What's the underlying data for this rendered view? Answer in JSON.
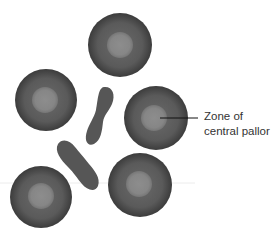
{
  "diagram": {
    "label": {
      "line1": "Zone of",
      "line2": "central pallor"
    },
    "colors": {
      "background": "#ffffff",
      "cell_rim": "#3f3f3f",
      "cell_body": "#5e5e5e",
      "pallor": "#8a8a8a",
      "sickle": "#555555",
      "leader_line": "#111111",
      "text": "#333333",
      "scan_line": "#ececec"
    },
    "cells": [
      {
        "name": "top",
        "cx": 120,
        "cy": 45,
        "r": 32,
        "pallor_r": 13
      },
      {
        "name": "left",
        "cx": 46,
        "cy": 100,
        "r": 31,
        "pallor_r": 13
      },
      {
        "name": "right",
        "cx": 156,
        "cy": 118,
        "r": 32,
        "pallor_r": 13
      },
      {
        "name": "bottom-right",
        "cx": 140,
        "cy": 185,
        "r": 32,
        "pallor_r": 13
      },
      {
        "name": "bottom-left",
        "cx": 41,
        "cy": 197,
        "r": 31,
        "pallor_r": 13
      }
    ],
    "leader_line": {
      "x1": 160,
      "y1": 118,
      "x2": 198,
      "y2": 118
    }
  }
}
